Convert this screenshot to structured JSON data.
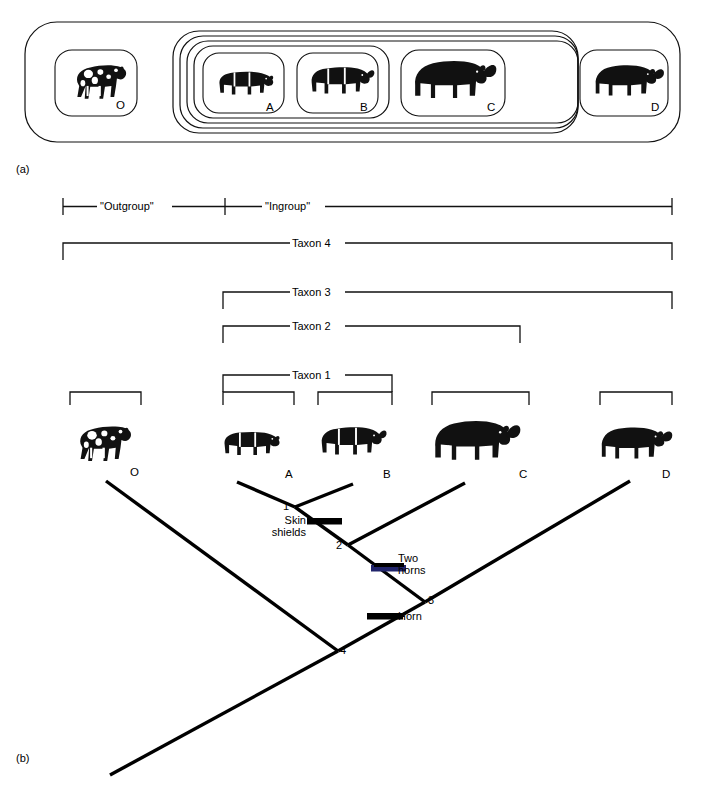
{
  "figure": {
    "panels": [
      {
        "id": "a",
        "label": "(a)"
      },
      {
        "id": "b",
        "label": "(b)"
      }
    ]
  },
  "panel_a": {
    "name": "nested-set-diagram",
    "specimens": [
      {
        "letter": "O",
        "icon": "horse-silhouette-icon"
      },
      {
        "letter": "A",
        "icon": "rhino-silhouette-icon"
      },
      {
        "letter": "B",
        "icon": "rhino-silhouette-icon"
      },
      {
        "letter": "C",
        "icon": "rhino-silhouette-icon"
      },
      {
        "letter": "D",
        "icon": "rhino-silhouette-icon"
      }
    ],
    "nested_groups": [
      {
        "name": "outermost-set",
        "members": "O A B C D"
      },
      {
        "name": "ingroup-set",
        "members": "A B C D"
      },
      {
        "name": "taxon-3-set",
        "members": "A B C"
      },
      {
        "name": "taxon-2-set",
        "members": "A B"
      }
    ]
  },
  "panel_b": {
    "name": "cladogram",
    "group_brackets": [
      {
        "label": "\"Outgroup\""
      },
      {
        "label": "\"Ingroup\""
      }
    ],
    "taxon_brackets": [
      {
        "label": "Taxon 4",
        "covers": "O A B C D"
      },
      {
        "label": "Taxon 3",
        "covers": "A B C D"
      },
      {
        "label": "Taxon 2",
        "covers": "A B C"
      },
      {
        "label": "Taxon 1",
        "covers": "A B"
      }
    ],
    "terminals": [
      {
        "letter": "O",
        "icon": "horse-silhouette-icon"
      },
      {
        "letter": "A",
        "icon": "rhino-silhouette-icon"
      },
      {
        "letter": "B",
        "icon": "rhino-silhouette-icon"
      },
      {
        "letter": "C",
        "icon": "rhino-silhouette-icon"
      },
      {
        "letter": "D",
        "icon": "rhino-silhouette-icon"
      }
    ],
    "nodes": [
      {
        "number": "1"
      },
      {
        "number": "2"
      },
      {
        "number": "3"
      },
      {
        "number": "4"
      }
    ],
    "character_marks": [
      {
        "label_line1": "Skin",
        "label_line2": "shields",
        "name": "skin-shields"
      },
      {
        "label_line1": "Two",
        "label_line2": "horns",
        "name": "two-horns"
      },
      {
        "label_line1": "Horn",
        "label_line2": "",
        "name": "horn"
      }
    ]
  },
  "colors": {
    "ink": "#000000",
    "line": "#1a1a1a",
    "background": "#ffffff"
  }
}
